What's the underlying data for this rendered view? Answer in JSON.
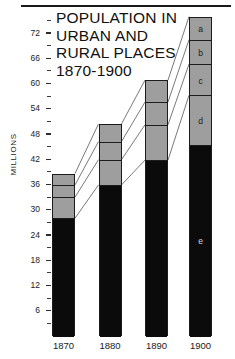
{
  "chart_data": {
    "type": "bar",
    "subtype": "stacked-bar",
    "title": "POPULATION IN URBAN AND RURAL PLACES 1870-1900",
    "title_lines": [
      "POPULATION IN",
      "URBAN AND",
      "RURAL PLACES",
      "1870-1900"
    ],
    "xlabel": "",
    "ylabel": "MILLIONS",
    "categories": [
      "1870",
      "1880",
      "1890",
      "1900"
    ],
    "ylim": [
      0,
      76
    ],
    "ytick_major": [
      6,
      12,
      18,
      24,
      30,
      36,
      42,
      48,
      54,
      60,
      66,
      72
    ],
    "ytick_labels": [
      "6",
      "12",
      "18",
      "24",
      "30",
      "36",
      "42",
      "48",
      "54",
      "60",
      "66",
      "72"
    ],
    "minor_ticks_between_majors": 1,
    "grid": false,
    "legend": "none",
    "stack_order_bottom_to_top": [
      "e",
      "d",
      "c",
      "b",
      "a"
    ],
    "series": [
      {
        "name": "e",
        "label": "e",
        "color": "#0b0b0b",
        "values": [
          28.0,
          35.9,
          41.8,
          45.4
        ]
      },
      {
        "name": "d",
        "label": "d",
        "color": "#9e9e9e",
        "values": [
          5.0,
          6.0,
          8.4,
          11.8
        ]
      },
      {
        "name": "c",
        "label": "c",
        "color": "#9e9e9e",
        "values": [
          2.9,
          4.3,
          5.4,
          7.4
        ]
      },
      {
        "name": "b",
        "label": "b",
        "color": "#9e9e9e",
        "values": [
          2.7,
          4.2,
          5.2,
          5.8
        ]
      },
      {
        "name": "a",
        "label": "a",
        "color": "#9e9e9e",
        "values": [
          0.0,
          0.0,
          0.0,
          5.5
        ]
      }
    ],
    "totals": [
      38.6,
      50.4,
      60.8,
      75.9
    ],
    "segment_labels_shown_on_bar": [
      "a",
      "b",
      "c",
      "d",
      "e"
    ],
    "colors": {
      "urban_fill": "#9e9e9e",
      "rural_fill": "#0b0b0b",
      "outline": "#1c1c1c",
      "text": "#1a1a1a",
      "background": "#ffffff"
    }
  }
}
